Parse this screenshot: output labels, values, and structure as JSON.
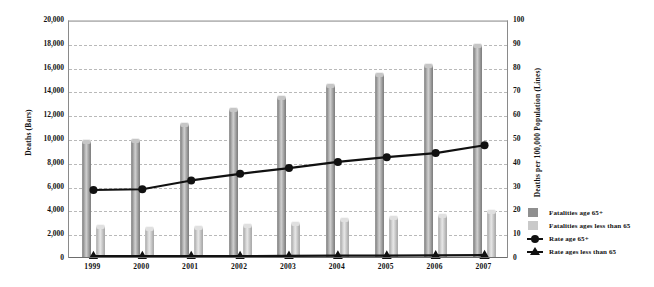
{
  "chart_data": {
    "type": "bar",
    "title": "",
    "categories": [
      "1999",
      "2000",
      "2001",
      "2002",
      "2003",
      "2004",
      "2005",
      "2006",
      "2007"
    ],
    "xlabel": "",
    "ylabel": "Deaths (Bars)",
    "y2label": "Deaths per 100,000 Population (Lines)",
    "ylim": [
      0,
      20000
    ],
    "y2lim": [
      0,
      100
    ],
    "grid": true,
    "legend_position": "right",
    "y_ticks": [
      "0",
      "2,000",
      "4,000",
      "6,000",
      "8,000",
      "10,000",
      "12,000",
      "14,000",
      "16,000",
      "18,000",
      "20,000"
    ],
    "y2_ticks": [
      "0",
      "10",
      "20",
      "30",
      "40",
      "50",
      "60",
      "70",
      "80",
      "90",
      "100"
    ],
    "series": [
      {
        "name": "Fatalities age 65+",
        "kind": "bar",
        "axis": "left",
        "color": "#8f8f8f",
        "values": [
          10000,
          10100,
          11400,
          12700,
          13700,
          14700,
          15600,
          16400,
          18100
        ]
      },
      {
        "name": "Fatalities ages less than 65",
        "kind": "bar",
        "axis": "left",
        "color": "#c9c9c9",
        "values": [
          2900,
          2700,
          2800,
          2950,
          3150,
          3450,
          3650,
          3800,
          4100
        ]
      },
      {
        "name": "Rate age 65+",
        "kind": "line",
        "axis": "right",
        "color": "#111111",
        "marker": "circle",
        "values": [
          29.0,
          29.3,
          33.0,
          35.8,
          38.2,
          40.8,
          42.8,
          44.5,
          47.8
        ]
      },
      {
        "name": "Rate ages less than 65",
        "kind": "line",
        "axis": "right",
        "color": "#111111",
        "marker": "triangle",
        "values": [
          1.2,
          1.2,
          1.2,
          1.2,
          1.3,
          1.4,
          1.4,
          1.5,
          1.6
        ]
      }
    ]
  },
  "axes": {
    "left_title": "Deaths (Bars)",
    "right_title": "Deaths per 100,000 Population (Lines)"
  },
  "legend": {
    "items": [
      {
        "label": "Fatalities age 65+",
        "key": "swatch-dark"
      },
      {
        "label": "Fatalities ages less than 65",
        "key": "swatch-light"
      },
      {
        "label": "Rate age 65+",
        "key": "line-circle"
      },
      {
        "label": "Rate ages less than 65",
        "key": "line-triangle"
      }
    ]
  }
}
